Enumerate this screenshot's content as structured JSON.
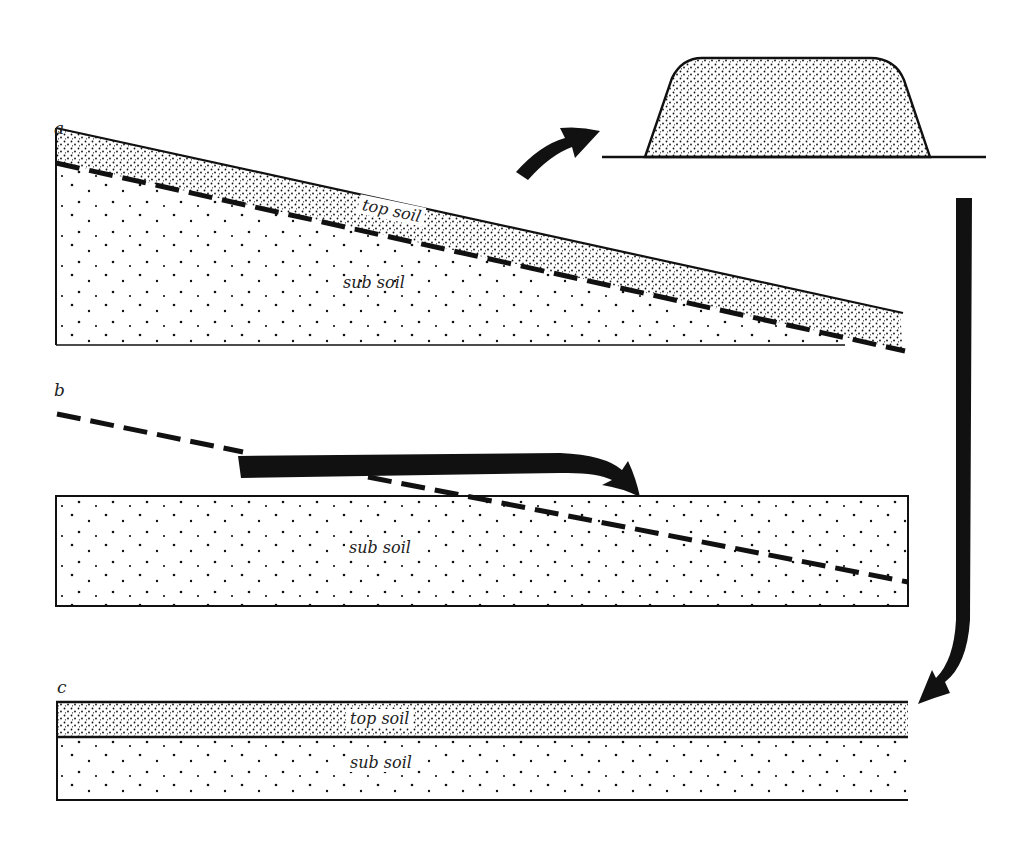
{
  "figure": {
    "colors": {
      "ink": "#111111",
      "paper": "#ffffff"
    }
  },
  "panels": {
    "a": {
      "label": "a",
      "top_layer": "top soil",
      "bottom_layer": "sub soil"
    },
    "b": {
      "label": "b",
      "layer": "sub soil"
    },
    "c": {
      "label": "c",
      "top_layer": "top soil",
      "bottom_layer": "sub soil"
    }
  },
  "stockpile": {
    "name": "topsoil-stockpile-mound"
  },
  "arrows": [
    {
      "name": "to-stockpile-arrow",
      "from": "panel-a",
      "to": "stockpile"
    },
    {
      "name": "regrade-arrow",
      "from": "panel-b-upper",
      "to": "panel-b-lower"
    },
    {
      "name": "return-topsoil-arrow",
      "from": "stockpile",
      "to": "panel-c"
    }
  ]
}
